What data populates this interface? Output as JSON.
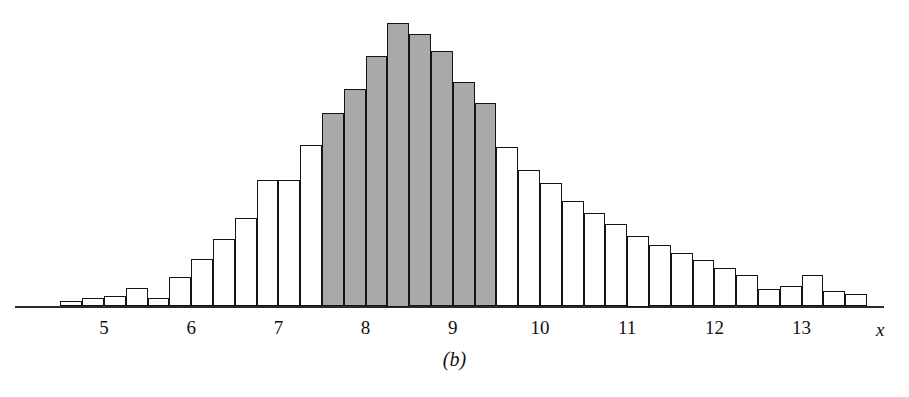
{
  "figure": {
    "caption": "(b)",
    "x_axis_label": "x",
    "ink_color": "#141414",
    "shade_color": "#a9a9a9",
    "fill_color": "#ffffff"
  },
  "chart_data": {
    "type": "bar",
    "title": "",
    "subtitle": "",
    "xlabel": "x",
    "ylabel": "",
    "grid": false,
    "legend": null,
    "annotations": [
      "(b)"
    ],
    "bin_width": 0.25,
    "xlim": [
      4.25,
      14.0
    ],
    "ylim": [
      0,
      1.0
    ],
    "xticks": [
      5,
      6,
      7,
      8,
      9,
      10,
      11,
      12,
      13
    ],
    "xtick_labels": [
      "5",
      "6",
      "7",
      "8",
      "9",
      "10",
      "11",
      "12",
      "13"
    ],
    "yticks": [],
    "ytick_labels": [],
    "shaded_range": [
      7.5,
      9.5
    ],
    "shaded_note": "Bars between x = 7.5 and x = 9.5 are filled gray",
    "bin_starts": [
      4.5,
      4.75,
      5.0,
      5.25,
      5.5,
      5.75,
      6.0,
      6.25,
      6.5,
      6.75,
      7.0,
      7.25,
      7.5,
      7.75,
      8.0,
      8.25,
      8.5,
      8.75,
      9.0,
      9.25,
      9.5,
      9.75,
      10.0,
      10.25,
      10.5,
      10.75,
      11.0,
      11.25,
      11.5,
      11.75,
      12.0,
      12.25,
      12.5,
      12.75,
      13.0,
      13.25,
      13.5
    ],
    "categories": [
      "4.50-4.75",
      "4.75-5.00",
      "5.00-5.25",
      "5.25-5.50",
      "5.50-5.75",
      "5.75-6.00",
      "6.00-6.25",
      "6.25-6.50",
      "6.50-6.75",
      "6.75-7.00",
      "7.00-7.25",
      "7.25-7.50",
      "7.50-7.75",
      "7.75-8.00",
      "8.00-8.25",
      "8.25-8.50",
      "8.50-8.75",
      "8.75-9.00",
      "9.00-9.25",
      "9.25-9.50",
      "9.50-9.75",
      "9.75-10.00",
      "10.00-10.25",
      "10.25-10.50",
      "10.50-10.75",
      "10.75-11.00",
      "11.00-11.25",
      "11.25-11.50",
      "11.50-11.75",
      "11.75-12.00",
      "12.00-12.25",
      "12.25-12.50",
      "12.50-12.75",
      "12.75-13.00",
      "13.00-13.25",
      "13.25-13.50",
      "13.50-13.75"
    ],
    "values": [
      0.018,
      0.03,
      0.037,
      0.066,
      0.03,
      0.103,
      0.169,
      0.239,
      0.312,
      0.445,
      0.445,
      0.57,
      0.68,
      0.767,
      0.883,
      1.0,
      0.96,
      0.898,
      0.792,
      0.715,
      0.56,
      0.48,
      0.435,
      0.372,
      0.33,
      0.29,
      0.25,
      0.215,
      0.19,
      0.165,
      0.135,
      0.11,
      0.062,
      0.072,
      0.11,
      0.055,
      0.044
    ],
    "shaded_flags": [
      false,
      false,
      false,
      false,
      false,
      false,
      false,
      false,
      false,
      false,
      false,
      false,
      true,
      true,
      true,
      true,
      true,
      true,
      true,
      true,
      false,
      false,
      false,
      false,
      false,
      false,
      false,
      false,
      false,
      false,
      false,
      false,
      false,
      false,
      false,
      false,
      false
    ]
  }
}
